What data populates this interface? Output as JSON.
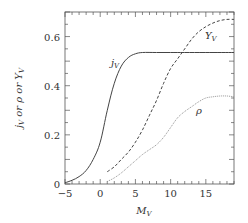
{
  "chart_data": {
    "type": "line",
    "title": "",
    "xlabel": "M_V",
    "ylabel": "j_V or ρ or Υ_V",
    "xlim": [
      -5,
      19
    ],
    "ylim": [
      0,
      0.7
    ],
    "xticks": [
      -5,
      0,
      5,
      10,
      15
    ],
    "yticks": [
      0,
      0.2,
      0.4,
      0.6
    ],
    "xtick_labels": [
      "−5",
      "0",
      "5",
      "10",
      "15"
    ],
    "ytick_labels": [
      "0",
      "0.2",
      "0.4",
      "0.6"
    ],
    "grid": false,
    "legend": "inline labels",
    "series": [
      {
        "name": "j_V",
        "style": "solid",
        "color": "#444444",
        "x": [
          -5,
          -4,
          -3,
          -2,
          -1,
          0,
          1,
          2,
          3,
          4,
          5,
          6,
          8,
          10,
          12,
          15,
          19
        ],
        "y": [
          0.005,
          0.015,
          0.03,
          0.055,
          0.1,
          0.17,
          0.3,
          0.41,
          0.48,
          0.515,
          0.53,
          0.535,
          0.535,
          0.535,
          0.535,
          0.535,
          0.535
        ]
      },
      {
        "name": "Υ_V",
        "style": "dashed",
        "color": "#444444",
        "x": [
          1,
          2,
          3,
          4,
          5,
          6,
          7,
          8,
          9,
          10,
          11,
          12,
          13,
          14,
          15,
          16,
          17,
          18,
          19
        ],
        "y": [
          0.05,
          0.07,
          0.1,
          0.13,
          0.17,
          0.22,
          0.28,
          0.34,
          0.41,
          0.47,
          0.51,
          0.55,
          0.59,
          0.62,
          0.64,
          0.655,
          0.665,
          0.67,
          0.67
        ]
      },
      {
        "name": "ρ",
        "style": "dotted",
        "color": "#888888",
        "x": [
          1,
          2,
          3,
          4,
          5,
          6,
          7,
          8,
          9,
          10,
          11,
          12,
          13,
          14,
          15,
          16,
          17,
          18,
          19
        ],
        "y": [
          0.01,
          0.025,
          0.045,
          0.07,
          0.095,
          0.12,
          0.14,
          0.16,
          0.19,
          0.23,
          0.27,
          0.295,
          0.315,
          0.335,
          0.35,
          0.355,
          0.358,
          0.358,
          0.355
        ]
      }
    ],
    "annotations": [
      {
        "text": "j_V",
        "x": 3.0,
        "y": 0.565
      },
      {
        "text": "Υ_V",
        "x": 15.8,
        "y": 0.6
      },
      {
        "text": "ρ",
        "x": 14.0,
        "y": 0.3
      }
    ]
  },
  "labels": {
    "x_axis": "M",
    "x_axis_sub": "V",
    "y_axis_j": "j",
    "y_axis_j_sub": "V",
    "y_axis_or1": " or ",
    "y_axis_rho": "ρ",
    "y_axis_or2": " or ",
    "y_axis_upsilon": "Υ",
    "y_axis_upsilon_sub": "V",
    "curve_j": "j",
    "curve_j_sub": "V",
    "curve_upsilon": "Υ",
    "curve_upsilon_sub": "V",
    "curve_rho": "ρ"
  }
}
